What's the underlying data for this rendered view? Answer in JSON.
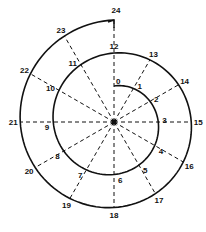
{
  "diagram": {
    "type": "spiral",
    "center": [
      114,
      122
    ],
    "start_radius": 36,
    "radius_step": 2.75,
    "angle_step_deg": 30,
    "colors": {
      "stroke": "#111111",
      "background": "#ffffff"
    },
    "points": [
      {
        "label": "0"
      },
      {
        "label": "1"
      },
      {
        "label": "2"
      },
      {
        "label": "3"
      },
      {
        "label": "4"
      },
      {
        "label": "5"
      },
      {
        "label": "6"
      },
      {
        "label": "7"
      },
      {
        "label": "8"
      },
      {
        "label": "9"
      },
      {
        "label": "10"
      },
      {
        "label": "11"
      },
      {
        "label": "12"
      },
      {
        "label": "13"
      },
      {
        "label": "14"
      },
      {
        "label": "15"
      },
      {
        "label": "16"
      },
      {
        "label": "17"
      },
      {
        "label": "18"
      },
      {
        "label": "19"
      },
      {
        "label": "20"
      },
      {
        "label": "21"
      },
      {
        "label": "22"
      },
      {
        "label": "23"
      },
      {
        "label": "24"
      }
    ]
  }
}
